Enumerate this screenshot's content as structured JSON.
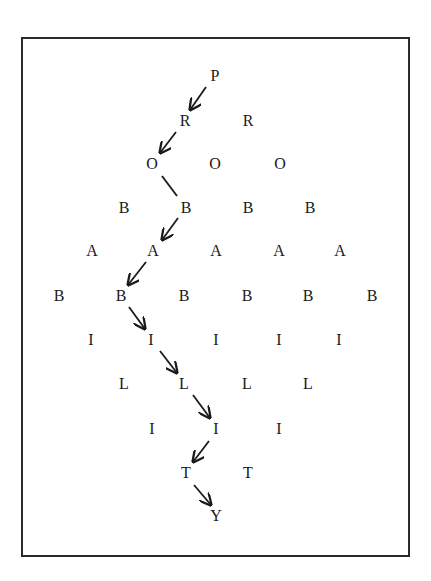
{
  "diagram": {
    "word": "PROBABILITY",
    "colors": {
      "border": "#2a2a2a",
      "text": "#1a1a1a",
      "arrow": "#1a1a1a"
    },
    "rows": [
      {
        "letter": "P",
        "y": 76,
        "xs": [
          215
        ]
      },
      {
        "letter": "R",
        "y": 121,
        "xs": [
          185,
          248
        ]
      },
      {
        "letter": "O",
        "y": 164,
        "xs": [
          152,
          215,
          280
        ]
      },
      {
        "letter": "B",
        "y": 208,
        "xs": [
          124,
          186,
          248,
          310
        ]
      },
      {
        "letter": "A",
        "y": 251,
        "xs": [
          92,
          153,
          216,
          279,
          340
        ]
      },
      {
        "letter": "B",
        "y": 296,
        "xs": [
          59,
          121,
          184,
          247,
          308,
          372
        ]
      },
      {
        "letter": "I",
        "y": 340,
        "xs": [
          91,
          151,
          216,
          279,
          339
        ]
      },
      {
        "letter": "L",
        "y": 384,
        "xs": [
          124,
          184,
          247,
          308
        ]
      },
      {
        "letter": "I",
        "y": 429,
        "xs": [
          152,
          216,
          279
        ]
      },
      {
        "letter": "T",
        "y": 473,
        "xs": [
          186,
          248
        ]
      },
      {
        "letter": "Y",
        "y": 516,
        "xs": [
          216
        ]
      }
    ],
    "path": [
      {
        "from": [
          206,
          87
        ],
        "to": [
          190,
          110
        ],
        "arrow": true
      },
      {
        "from": [
          176,
          132
        ],
        "to": [
          160,
          153
        ],
        "arrow": true
      },
      {
        "from": [
          162,
          176
        ],
        "to": [
          177,
          196
        ],
        "arrow": false
      },
      {
        "from": [
          178,
          218
        ],
        "to": [
          162,
          240
        ],
        "arrow": true
      },
      {
        "from": [
          146,
          262
        ],
        "to": [
          128,
          285
        ],
        "arrow": true
      },
      {
        "from": [
          129,
          307
        ],
        "to": [
          145,
          329
        ],
        "arrow": true
      },
      {
        "from": [
          160,
          351
        ],
        "to": [
          177,
          373
        ],
        "arrow": true
      },
      {
        "from": [
          193,
          395
        ],
        "to": [
          210,
          418
        ],
        "arrow": true
      },
      {
        "from": [
          209,
          441
        ],
        "to": [
          193,
          462
        ],
        "arrow": true
      },
      {
        "from": [
          194,
          485
        ],
        "to": [
          211,
          505
        ],
        "arrow": true
      }
    ]
  }
}
